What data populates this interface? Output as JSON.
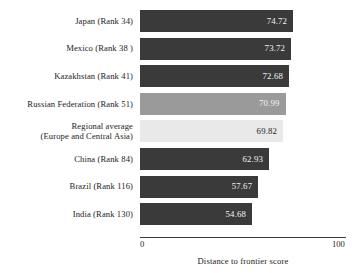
{
  "chart_data": {
    "type": "bar",
    "orientation": "horizontal",
    "title": "",
    "xlabel": "Distance to frontier score",
    "ylabel": "",
    "xlim": [
      0,
      100
    ],
    "xticks": [
      0,
      100
    ],
    "xtick_labels": [
      "0",
      "100"
    ],
    "grid": false,
    "legend": false,
    "categories": [
      "Japan (Rank 34)",
      "Mexico (Rank 38 )",
      "Kazakhstan (Rank 41)",
      "Russian Federation (Rank 51)",
      "Regional average\n(Europe and Central Asia)",
      "China (Rank 84)",
      "Brazil (Rank 116)",
      "India (Rank 130)"
    ],
    "values": [
      74.72,
      73.72,
      72.68,
      70.99,
      69.82,
      62.93,
      57.67,
      54.68
    ],
    "value_labels": [
      "74.72",
      "73.72",
      "72.68",
      "70.99",
      "69.82",
      "62.93",
      "57.67",
      "54.68"
    ],
    "bar_colors": [
      "#3a3a3a",
      "#3a3a3a",
      "#3a3a3a",
      "#9a9a9a",
      "#e9e9e9",
      "#3a3a3a",
      "#3a3a3a",
      "#3a3a3a"
    ]
  },
  "bars": [
    {
      "label_line1": "Japan (Rank 34)",
      "label_line2": "",
      "value_label": "74.72",
      "value": 74.72,
      "color": "#3a3a3a",
      "label_on_dark": true
    },
    {
      "label_line1": "Mexico (Rank 38 )",
      "label_line2": "",
      "value_label": "73.72",
      "value": 73.72,
      "color": "#3a3a3a",
      "label_on_dark": true
    },
    {
      "label_line1": "Kazakhstan (Rank 41)",
      "label_line2": "",
      "value_label": "72.68",
      "value": 72.68,
      "color": "#3a3a3a",
      "label_on_dark": true
    },
    {
      "label_line1": "Russian Federation (Rank 51)",
      "label_line2": "",
      "value_label": "70.99",
      "value": 70.99,
      "color": "#9a9a9a",
      "label_on_dark": true
    },
    {
      "label_line1": "Regional average",
      "label_line2": "(Europe and Central Asia)",
      "value_label": "69.82",
      "value": 69.82,
      "color": "#e9e9e9",
      "label_on_dark": false
    },
    {
      "label_line1": "China (Rank 84)",
      "label_line2": "",
      "value_label": "62.93",
      "value": 62.93,
      "color": "#3a3a3a",
      "label_on_dark": true
    },
    {
      "label_line1": "Brazil (Rank 116)",
      "label_line2": "",
      "value_label": "57.67",
      "value": 57.67,
      "color": "#3a3a3a",
      "label_on_dark": true
    },
    {
      "label_line1": "India (Rank 130)",
      "label_line2": "",
      "value_label": "54.68",
      "value": 54.68,
      "color": "#3a3a3a",
      "label_on_dark": true
    }
  ],
  "axis": {
    "tick_min": "0",
    "tick_max": "100",
    "title": "Distance to frontier score"
  }
}
